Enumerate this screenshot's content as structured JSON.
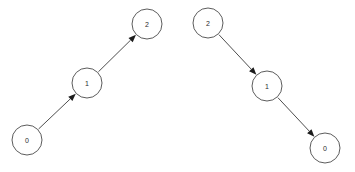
{
  "canvas": {
    "width": 355,
    "height": 172,
    "background_color": "#ffffff"
  },
  "style": {
    "node_fill": "#ffffff",
    "node_stroke": "#4a4a4a",
    "node_radius": 15,
    "edge_color": "#3a3a3a",
    "arrowhead_color": "#1c1c1c",
    "label_color": "#2b2b2b"
  },
  "graphs": [
    {
      "id": "left-graph",
      "name": "ascending-chain",
      "nodes": [
        {
          "id": "L0",
          "label": "0",
          "cx": 27,
          "cy": 140,
          "r": 15
        },
        {
          "id": "L1",
          "label": "1",
          "cx": 87,
          "cy": 83,
          "r": 15
        },
        {
          "id": "L2",
          "label": "2",
          "cx": 147,
          "cy": 24,
          "r": 15
        }
      ],
      "edges": [
        {
          "id": "L0-L1",
          "from": "L0",
          "to": "L1",
          "directed": true
        },
        {
          "id": "L1-L2",
          "from": "L1",
          "to": "L2",
          "directed": true
        }
      ]
    },
    {
      "id": "right-graph",
      "name": "descending-chain",
      "nodes": [
        {
          "id": "R2",
          "label": "2",
          "cx": 208,
          "cy": 23,
          "r": 15
        },
        {
          "id": "R1",
          "label": "1",
          "cx": 267,
          "cy": 86,
          "r": 15
        },
        {
          "id": "R0",
          "label": "0",
          "cx": 325,
          "cy": 148,
          "r": 15
        }
      ],
      "edges": [
        {
          "id": "R2-R1",
          "from": "R2",
          "to": "R1",
          "directed": true
        },
        {
          "id": "R1-R0",
          "from": "R1",
          "to": "R0",
          "directed": true
        }
      ]
    }
  ],
  "chart_data": {
    "type": "diagram",
    "title": "",
    "subtitle": "",
    "diagram_kind": "directed-graph-pair",
    "panels": [
      {
        "name": "left",
        "nodes": [
          "0",
          "1",
          "2"
        ],
        "edges": [
          [
            "0",
            "1"
          ],
          [
            "1",
            "2"
          ]
        ],
        "direction": "up-right"
      },
      {
        "name": "right",
        "nodes": [
          "2",
          "1",
          "0"
        ],
        "edges": [
          [
            "2",
            "1"
          ],
          [
            "1",
            "0"
          ]
        ],
        "direction": "down-right"
      }
    ]
  }
}
